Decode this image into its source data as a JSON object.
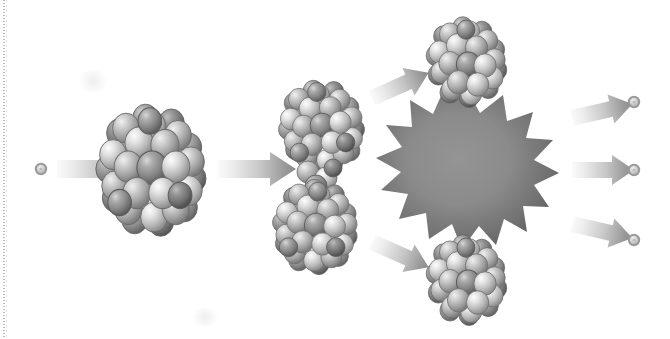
{
  "figure": {
    "background_color": "#ffffff",
    "width": 670,
    "height": 339,
    "alt_text": "A neutron strikes a heavy nucleus, which elongates, splits into two fragments with a burst of energy, and releases three neutrons."
  },
  "palette": {
    "background": "#ffffff",
    "nucleon_light": "#e8e8e8",
    "nucleon_mid": "#b4b4b4",
    "nucleon_dark": "#6e6e6e",
    "nucleon_outline": "#5a5a5a",
    "arrow_light": "#f2f2f2",
    "arrow_dark": "#8a8a8a",
    "burst_center": "#8d8d8d",
    "burst_edge": "#5f5f5f",
    "neutron_ring": "#9a9a9a",
    "neutron_core": "#d8d8d8",
    "scan_line": "#8f8f8f"
  },
  "stages": [
    {
      "id": "incoming-neutron",
      "label": "Incoming neutron",
      "kind": "neutron",
      "x": 41,
      "y": 169,
      "radius": 5
    },
    {
      "id": "arrow-1",
      "label": "Neutron approach arrow",
      "kind": "arrow",
      "direction": "right",
      "x": 57,
      "y": 169,
      "length": 78,
      "thickness": 26
    },
    {
      "id": "target-nucleus",
      "label": "Heavy target nucleus",
      "kind": "nucleus",
      "shape": "round",
      "x": 152,
      "y": 169,
      "rx": 48,
      "ry": 55,
      "nucleon_count": 46
    },
    {
      "id": "arrow-2",
      "label": "Transition arrow",
      "kind": "arrow",
      "direction": "right",
      "x": 218,
      "y": 169,
      "length": 78,
      "thickness": 26
    },
    {
      "id": "elongated-nucleus",
      "label": "Elongated deforming nucleus",
      "kind": "nucleus",
      "shape": "dumbbell",
      "x": 319,
      "y": 176,
      "rx": 38,
      "ry": 96,
      "nucleon_count": 52
    },
    {
      "id": "arrow-up",
      "label": "Fission fragment arrow upper",
      "kind": "arrow",
      "direction": "up-right",
      "x": 370,
      "y": 95,
      "length": 62,
      "thickness": 26,
      "angle": -25
    },
    {
      "id": "arrow-down",
      "label": "Fission fragment arrow lower",
      "kind": "arrow",
      "direction": "down-right",
      "x": 370,
      "y": 245,
      "length": 62,
      "thickness": 26,
      "angle": 25
    },
    {
      "id": "fragment-top",
      "label": "Upper fission fragment nucleus",
      "kind": "nucleus",
      "shape": "round",
      "x": 467,
      "y": 60,
      "rx": 35,
      "ry": 40,
      "nucleon_count": 32
    },
    {
      "id": "fragment-bottom",
      "label": "Lower fission fragment nucleus",
      "kind": "nucleus",
      "shape": "round",
      "x": 467,
      "y": 278,
      "rx": 35,
      "ry": 40,
      "nucleon_count": 32
    },
    {
      "id": "energy-burst",
      "label": "Energy release burst",
      "kind": "starburst",
      "x": 466,
      "y": 169,
      "outer_radius": 78,
      "inner_radius": 49,
      "points": 15
    },
    {
      "id": "arrow-neutron-1",
      "label": "Released neutron arrow upper",
      "kind": "arrow",
      "direction": "up-right",
      "x": 580,
      "y": 115,
      "length": 62,
      "thickness": 24,
      "angle": -14
    },
    {
      "id": "arrow-neutron-2",
      "label": "Released neutron arrow middle",
      "kind": "arrow",
      "direction": "right",
      "x": 580,
      "y": 169,
      "length": 62,
      "thickness": 24,
      "angle": 0
    },
    {
      "id": "arrow-neutron-3",
      "label": "Released neutron arrow lower",
      "kind": "arrow",
      "direction": "down-right",
      "x": 580,
      "y": 228,
      "length": 62,
      "thickness": 24,
      "angle": 14
    },
    {
      "id": "neutron-out-1",
      "label": "Released neutron upper",
      "kind": "neutron",
      "x": 634,
      "y": 102,
      "radius": 5
    },
    {
      "id": "neutron-out-2",
      "label": "Released neutron middle",
      "kind": "neutron",
      "x": 634,
      "y": 170,
      "radius": 5
    },
    {
      "id": "neutron-out-3",
      "label": "Released neutron lower",
      "kind": "neutron",
      "x": 634,
      "y": 240,
      "radius": 5
    }
  ],
  "artifacts": {
    "left_scan_line": "dotted vertical scan line at left page edge",
    "smudges": [
      {
        "x": 76,
        "y": 72,
        "w": 34,
        "h": 22
      },
      {
        "x": 190,
        "y": 310,
        "w": 28,
        "h": 18
      }
    ]
  }
}
